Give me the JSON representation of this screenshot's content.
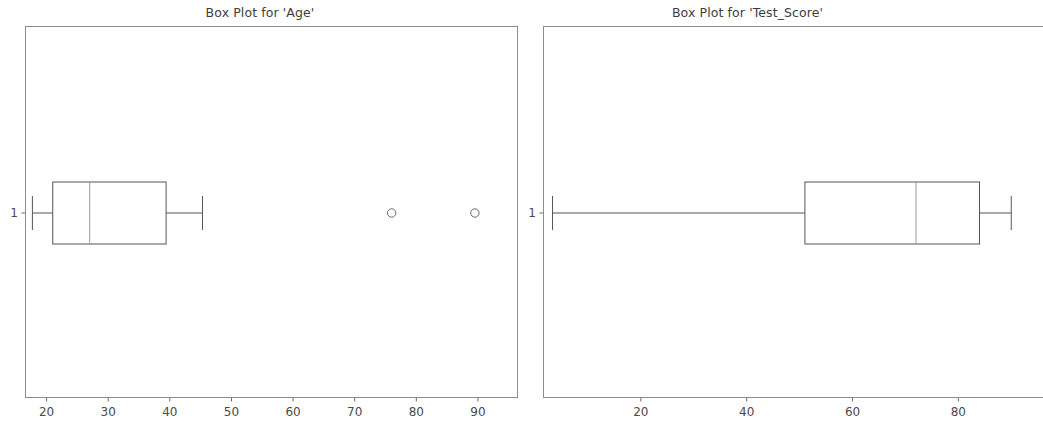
{
  "figure": {
    "width": 1020,
    "height": 423,
    "background": "#ffffff",
    "line_color": "#555555",
    "frame_color": "#8d8d8d",
    "text_color": "#3d3d3d"
  },
  "chart_data": [
    {
      "type": "box",
      "title": "Box Plot for 'Age'",
      "xlabel": "",
      "ylabel": "",
      "orientation": "horizontal",
      "grid": false,
      "legend": null,
      "xlim": [
        16.5,
        96.5
      ],
      "xticks": [
        20,
        30,
        40,
        50,
        60,
        70,
        80,
        90
      ],
      "xtick_labels": [
        "20",
        "30",
        "40",
        "50",
        "60",
        "70",
        "80",
        "90"
      ],
      "yticks": [
        1
      ],
      "ytick_labels": [
        "1"
      ],
      "boxes": [
        {
          "label": "1",
          "whisker_low": 17.7,
          "q1": 21.0,
          "median": 27.0,
          "q3": 39.4,
          "whisker_high": 45.3,
          "outliers": [
            76.0,
            89.5
          ]
        }
      ]
    },
    {
      "type": "box",
      "title": "Box Plot for 'Test_Score'",
      "xlabel": "",
      "ylabel": "",
      "orientation": "horizontal",
      "grid": false,
      "legend": null,
      "xlim": [
        1.5,
        96.0
      ],
      "xticks": [
        20,
        40,
        60,
        80
      ],
      "xtick_labels": [
        "20",
        "40",
        "60",
        "80"
      ],
      "yticks": [
        1
      ],
      "ytick_labels": [
        "1"
      ],
      "boxes": [
        {
          "label": "1",
          "whisker_low": 3.3,
          "q1": 51.0,
          "median": 72.0,
          "q3": 84.0,
          "whisker_high": 90.0,
          "outliers": []
        }
      ]
    }
  ]
}
